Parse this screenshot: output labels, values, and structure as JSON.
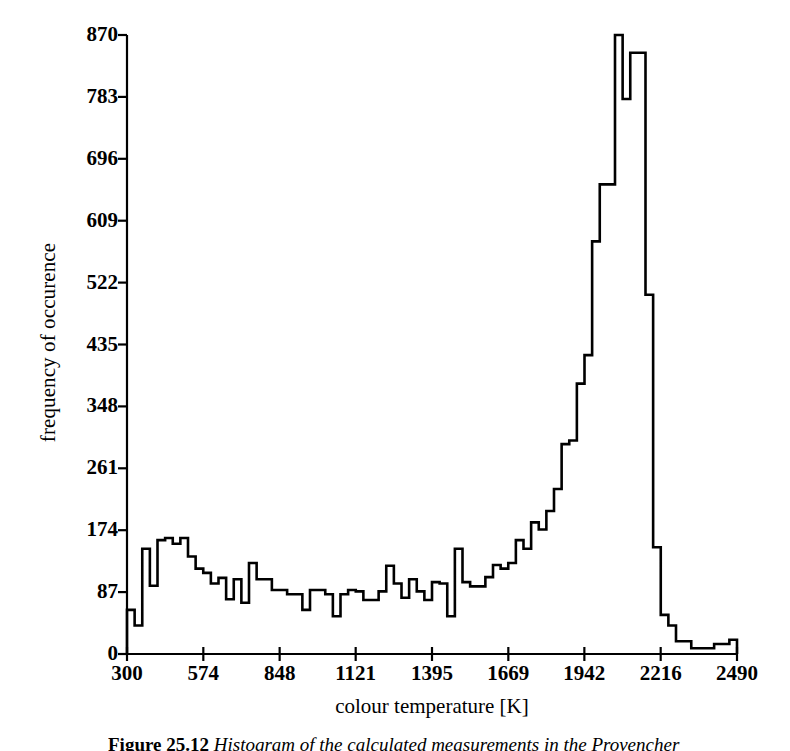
{
  "figure": {
    "caption_label": "Figure 25.12",
    "caption_text": "Histogram of the calculated measurements in the Provencher"
  },
  "chart_data": {
    "type": "bar",
    "subtype": "histogram",
    "title": "",
    "xlabel": "colour temperature [K]",
    "ylabel": "frequency of occurence",
    "xlim": [
      300,
      2490
    ],
    "ylim": [
      0,
      870
    ],
    "grid": false,
    "legend": null,
    "x_ticks": [
      300,
      574,
      848,
      1121,
      1395,
      1669,
      1942,
      2216,
      2490
    ],
    "y_ticks": [
      0,
      87,
      174,
      261,
      348,
      435,
      522,
      609,
      696,
      783,
      870
    ],
    "bin_width": 27.375,
    "bin_edges": [
      300,
      327.4,
      354.8,
      382.1,
      409.5,
      436.9,
      464.3,
      491.6,
      519,
      546.4,
      573.8,
      601.1,
      628.5,
      655.9,
      683.3,
      710.6,
      738,
      765.4,
      792.8,
      820.1,
      847.5,
      874.9,
      902.3,
      929.6,
      957,
      984.4,
      1011.8,
      1039.1,
      1066.5,
      1093.9,
      1121.3,
      1148.6,
      1176,
      1203.4,
      1230.8,
      1258.1,
      1285.5,
      1312.9,
      1340.3,
      1367.6,
      1395,
      1422.4,
      1449.8,
      1477.1,
      1504.5,
      1531.9,
      1559.3,
      1586.6,
      1614,
      1641.4,
      1668.8,
      1696.1,
      1723.5,
      1750.9,
      1778.3,
      1805.6,
      1833,
      1860.4,
      1887.8,
      1915.1,
      1942.5,
      1969.9,
      1997.3,
      2024.6,
      2052,
      2079.4,
      2106.8,
      2134.1,
      2161.5,
      2188.9,
      2216.3,
      2243.6,
      2271,
      2298.4,
      2325.8,
      2353.1,
      2380.5,
      2407.9,
      2435.3,
      2462.6,
      2490
    ],
    "values": [
      62,
      62,
      40,
      40,
      148,
      148,
      96,
      96,
      160,
      160,
      163,
      163,
      155,
      155,
      137,
      137,
      120,
      120,
      114,
      114,
      99,
      99,
      107,
      107,
      77,
      77,
      72,
      72,
      128,
      128,
      105,
      105,
      105,
      105,
      90,
      90,
      84,
      84,
      84,
      84,
      90,
      90,
      53,
      53,
      124,
      124,
      79,
      79,
      79,
      79,
      99,
      99,
      148,
      148,
      101,
      101,
      99,
      99,
      108,
      108,
      125,
      125,
      160,
      160,
      185,
      185,
      201,
      201,
      232,
      232,
      295,
      295,
      380,
      380,
      580,
      580,
      660,
      660
    ],
    "bars": [
      {
        "x0": 300,
        "x1": 327.4,
        "y": 62
      },
      {
        "x0": 327.4,
        "x1": 354.8,
        "y": 40
      },
      {
        "x0": 354.8,
        "x1": 382.1,
        "y": 148
      },
      {
        "x0": 382.1,
        "x1": 409.5,
        "y": 96
      },
      {
        "x0": 409.5,
        "x1": 436.9,
        "y": 160
      },
      {
        "x0": 436.9,
        "x1": 464.3,
        "y": 163
      },
      {
        "x0": 464.3,
        "x1": 491.6,
        "y": 155
      },
      {
        "x0": 491.6,
        "x1": 519,
        "y": 163
      },
      {
        "x0": 519,
        "x1": 546.4,
        "y": 137
      },
      {
        "x0": 546.4,
        "x1": 573.8,
        "y": 120
      },
      {
        "x0": 573.8,
        "x1": 601.1,
        "y": 114
      },
      {
        "x0": 601.1,
        "x1": 628.5,
        "y": 99
      },
      {
        "x0": 628.5,
        "x1": 655.9,
        "y": 107
      },
      {
        "x0": 655.9,
        "x1": 683.3,
        "y": 77
      },
      {
        "x0": 683.3,
        "x1": 710.6,
        "y": 105
      },
      {
        "x0": 710.6,
        "x1": 738,
        "y": 72
      },
      {
        "x0": 738,
        "x1": 765.4,
        "y": 128
      },
      {
        "x0": 765.4,
        "x1": 792.8,
        "y": 105
      },
      {
        "x0": 792.8,
        "x1": 820.1,
        "y": 105
      },
      {
        "x0": 820.1,
        "x1": 847.5,
        "y": 90
      },
      {
        "x0": 847.5,
        "x1": 874.9,
        "y": 90
      },
      {
        "x0": 874.9,
        "x1": 902.3,
        "y": 84
      },
      {
        "x0": 902.3,
        "x1": 929.6,
        "y": 84
      },
      {
        "x0": 929.6,
        "x1": 957,
        "y": 62
      },
      {
        "x0": 957,
        "x1": 984.4,
        "y": 90
      },
      {
        "x0": 984.4,
        "x1": 1011.8,
        "y": 90
      },
      {
        "x0": 1011.8,
        "x1": 1039.1,
        "y": 84
      },
      {
        "x0": 1039.1,
        "x1": 1066.5,
        "y": 53
      },
      {
        "x0": 1066.5,
        "x1": 1093.9,
        "y": 84
      },
      {
        "x0": 1093.9,
        "x1": 1121.3,
        "y": 90
      },
      {
        "x0": 1121.3,
        "x1": 1148.6,
        "y": 88
      },
      {
        "x0": 1148.6,
        "x1": 1176,
        "y": 76
      },
      {
        "x0": 1176,
        "x1": 1203.4,
        "y": 76
      },
      {
        "x0": 1203.4,
        "x1": 1230.8,
        "y": 88
      },
      {
        "x0": 1230.8,
        "x1": 1258.1,
        "y": 124
      },
      {
        "x0": 1258.1,
        "x1": 1285.5,
        "y": 99
      },
      {
        "x0": 1285.5,
        "x1": 1312.9,
        "y": 79
      },
      {
        "x0": 1312.9,
        "x1": 1340.3,
        "y": 105
      },
      {
        "x0": 1340.3,
        "x1": 1367.6,
        "y": 88
      },
      {
        "x0": 1367.6,
        "x1": 1395,
        "y": 76
      },
      {
        "x0": 1395,
        "x1": 1422.4,
        "y": 101
      },
      {
        "x0": 1422.4,
        "x1": 1449.8,
        "y": 99
      },
      {
        "x0": 1449.8,
        "x1": 1477.1,
        "y": 53
      },
      {
        "x0": 1477.1,
        "x1": 1504.5,
        "y": 148
      },
      {
        "x0": 1504.5,
        "x1": 1531.9,
        "y": 101
      },
      {
        "x0": 1531.9,
        "x1": 1559.3,
        "y": 95
      },
      {
        "x0": 1559.3,
        "x1": 1586.6,
        "y": 95
      },
      {
        "x0": 1586.6,
        "x1": 1614,
        "y": 108
      },
      {
        "x0": 1614,
        "x1": 1641.4,
        "y": 125
      },
      {
        "x0": 1641.4,
        "x1": 1668.8,
        "y": 120
      },
      {
        "x0": 1668.8,
        "x1": 1696.1,
        "y": 128
      },
      {
        "x0": 1696.1,
        "x1": 1723.5,
        "y": 160
      },
      {
        "x0": 1723.5,
        "x1": 1750.9,
        "y": 148
      },
      {
        "x0": 1750.9,
        "x1": 1778.3,
        "y": 185
      },
      {
        "x0": 1778.3,
        "x1": 1805.6,
        "y": 175
      },
      {
        "x0": 1805.6,
        "x1": 1833,
        "y": 201
      },
      {
        "x0": 1833,
        "x1": 1860.4,
        "y": 232
      },
      {
        "x0": 1860.4,
        "x1": 1887.8,
        "y": 295
      },
      {
        "x0": 1887.8,
        "x1": 1915.1,
        "y": 300
      },
      {
        "x0": 1915.1,
        "x1": 1942.5,
        "y": 380
      },
      {
        "x0": 1942.5,
        "x1": 1969.9,
        "y": 420
      },
      {
        "x0": 1969.9,
        "x1": 1997.3,
        "y": 580
      },
      {
        "x0": 1997.3,
        "x1": 2024.6,
        "y": 660
      },
      {
        "x0": 2024.6,
        "x1": 2052,
        "y": 660
      },
      {
        "x0": 2052,
        "x1": 2079.4,
        "y": 870
      },
      {
        "x0": 2079.4,
        "x1": 2106.8,
        "y": 780
      },
      {
        "x0": 2106.8,
        "x1": 2134.1,
        "y": 845
      },
      {
        "x0": 2134.1,
        "x1": 2161.5,
        "y": 845
      },
      {
        "x0": 2161.5,
        "x1": 2188.9,
        "y": 505
      },
      {
        "x0": 2188.9,
        "x1": 2216.3,
        "y": 150
      },
      {
        "x0": 2216.3,
        "x1": 2243.6,
        "y": 55
      },
      {
        "x0": 2243.6,
        "x1": 2271,
        "y": 40
      },
      {
        "x0": 2271,
        "x1": 2298.4,
        "y": 18
      },
      {
        "x0": 2298.4,
        "x1": 2325.8,
        "y": 18
      },
      {
        "x0": 2325.8,
        "x1": 2353.1,
        "y": 8
      },
      {
        "x0": 2353.1,
        "x1": 2380.5,
        "y": 8
      },
      {
        "x0": 2380.5,
        "x1": 2407.9,
        "y": 8
      },
      {
        "x0": 2407.9,
        "x1": 2435.3,
        "y": 14
      },
      {
        "x0": 2435.3,
        "x1": 2462.6,
        "y": 14
      },
      {
        "x0": 2462.6,
        "x1": 2490,
        "y": 20
      }
    ]
  },
  "style": {
    "line_color": "#000000",
    "axis_color": "#000000",
    "background": "#ffffff"
  }
}
